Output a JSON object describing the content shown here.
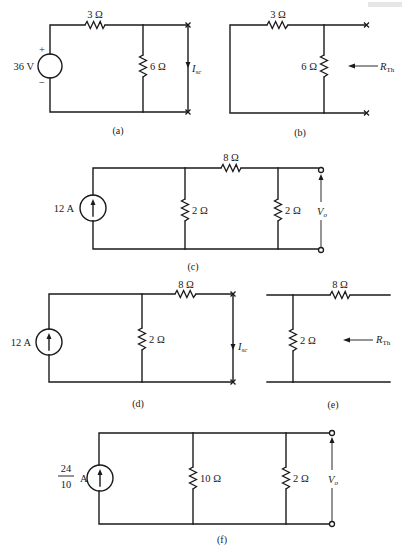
{
  "figure": {
    "panels": [
      {
        "id": "a",
        "caption": "(a)",
        "source": {
          "type": "voltage",
          "label": "36 V",
          "plus": "+",
          "minus": "−"
        },
        "series_resistor": {
          "label": "3 Ω"
        },
        "shunt_resistor": {
          "label": "6 Ω"
        },
        "output": {
          "label": "I",
          "subscript": "sc",
          "terminals": "short-circuit",
          "terminal_marker": "x"
        }
      },
      {
        "id": "b",
        "caption": "(b)",
        "series_resistor": {
          "label": "3 Ω"
        },
        "shunt_resistor": {
          "label": "6 Ω"
        },
        "output": {
          "label": "R",
          "subscript": "Th",
          "terminal_marker": "x"
        }
      },
      {
        "id": "c",
        "caption": "(c)",
        "source": {
          "type": "current",
          "label": "12 A",
          "direction": "up"
        },
        "shunt_resistor_1": {
          "label": "2 Ω"
        },
        "series_resistor": {
          "label": "8 Ω"
        },
        "shunt_resistor_2": {
          "label": "2 Ω"
        },
        "output": {
          "label": "V",
          "subscript": "o",
          "terminal_marker": "o"
        }
      },
      {
        "id": "d",
        "caption": "(d)",
        "source": {
          "type": "current",
          "label": "12 A",
          "direction": "up"
        },
        "shunt_resistor": {
          "label": "2 Ω"
        },
        "series_resistor": {
          "label": "8 Ω"
        },
        "output": {
          "label": "I",
          "subscript": "sc",
          "terminals": "short-circuit",
          "terminal_marker": "x"
        }
      },
      {
        "id": "e",
        "caption": "(e)",
        "shunt_resistor": {
          "label": "2 Ω"
        },
        "series_resistor": {
          "label": "8 Ω"
        },
        "output": {
          "label": "R",
          "subscript": "Th"
        }
      },
      {
        "id": "f",
        "caption": "(f)",
        "source": {
          "type": "current",
          "numerator": "24",
          "denominator": "10",
          "unit": "A",
          "direction": "up"
        },
        "shunt_resistor_1": {
          "label": "10 Ω"
        },
        "shunt_resistor_2": {
          "label": "2 Ω"
        },
        "output": {
          "label": "V",
          "subscript": "o",
          "terminal_marker": "o"
        }
      }
    ]
  }
}
